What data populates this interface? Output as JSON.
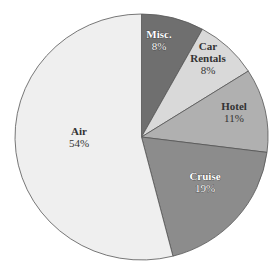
{
  "chart_data": {
    "type": "pie",
    "title": "",
    "start_angle_deg": 0,
    "direction": "clockwise",
    "slices": [
      {
        "label": "Misc.",
        "value": 8,
        "display": "8%",
        "color": "#6f6f6f",
        "text_color": "#ffffff",
        "text_outline": "#333333"
      },
      {
        "label": "Car Rentals",
        "value": 8,
        "display": "8%",
        "color": "#d9d9d9",
        "text_color": "#333333",
        "text_outline": ""
      },
      {
        "label": "Hotel",
        "value": 11,
        "display": "11%",
        "color": "#b0b0b0",
        "text_color": "#333333",
        "text_outline": ""
      },
      {
        "label": "Cruise",
        "value": 19,
        "display": "19%",
        "color": "#8c8c8c",
        "text_color": "#ffffff",
        "text_outline": "#333333"
      },
      {
        "label": "Air",
        "value": 54,
        "display": "54%",
        "color": "#efefef",
        "text_color": "#333333",
        "text_outline": ""
      }
    ],
    "legend": "none"
  },
  "layout": {
    "cx": 141.5,
    "cy": 137,
    "rx": 126.5,
    "ry": 123,
    "stroke": "#555555",
    "label_positions": [
      {
        "x": 159,
        "y": 40
      },
      {
        "x": 208,
        "y": 58
      },
      {
        "x": 234,
        "y": 112
      },
      {
        "x": 205,
        "y": 182
      },
      {
        "x": 79,
        "y": 137
      }
    ]
  }
}
